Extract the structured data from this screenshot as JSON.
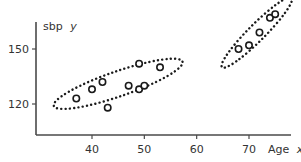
{
  "chart_data": {
    "type": "scatter",
    "title": "",
    "xlabel": "Age",
    "xlabel_var": "x",
    "ylabel": "sbp",
    "ylabel_var": "y",
    "xlim": [
      27,
      82
    ],
    "ylim": [
      103,
      177
    ],
    "x_ticks": [
      40,
      50,
      60,
      70
    ],
    "y_ticks": [
      120,
      150
    ],
    "grid": false,
    "legend": "none",
    "series": [
      {
        "name": "cluster-1",
        "points": [
          {
            "x": 37,
            "y": 123
          },
          {
            "x": 40,
            "y": 128
          },
          {
            "x": 42,
            "y": 132
          },
          {
            "x": 43,
            "y": 118
          },
          {
            "x": 47,
            "y": 130
          },
          {
            "x": 49,
            "y": 142
          },
          {
            "x": 49,
            "y": 128
          },
          {
            "x": 50,
            "y": 130
          },
          {
            "x": 53,
            "y": 140
          }
        ],
        "enclosure": {
          "center": {
            "x": 45,
            "y": 131
          },
          "semi_major_x_units": 13,
          "semi_minor_y_units": 11,
          "angle_deg": -19
        }
      },
      {
        "name": "cluster-2",
        "points": [
          {
            "x": 68,
            "y": 150
          },
          {
            "x": 70,
            "y": 152
          },
          {
            "x": 72,
            "y": 159
          },
          {
            "x": 74,
            "y": 167
          },
          {
            "x": 75,
            "y": 169
          }
        ],
        "enclosure": {
          "center": {
            "x": 71.5,
            "y": 159
          },
          "semi_major_x_units": 9.4,
          "semi_minor_y_units": 7.3,
          "angle_deg": -45
        }
      }
    ]
  }
}
